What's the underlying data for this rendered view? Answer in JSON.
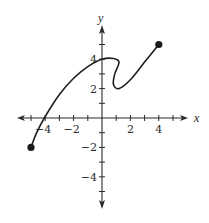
{
  "chart_data": {
    "type": "line",
    "title": "",
    "xlabel": "x",
    "ylabel": "y",
    "xlim": [
      -6,
      6
    ],
    "ylim": [
      -6,
      6
    ],
    "grid": false,
    "x_ticks": [
      -5,
      -4,
      -3,
      -2,
      -1,
      1,
      2,
      3,
      4,
      5
    ],
    "x_tick_labels": [
      {
        "value": -4,
        "label": "−4"
      },
      {
        "value": -2,
        "label": "−2"
      },
      {
        "value": 2,
        "label": "2"
      },
      {
        "value": 4,
        "label": "4"
      }
    ],
    "y_ticks": [
      -5,
      -4,
      -3,
      -2,
      -1,
      1,
      2,
      3,
      4,
      5
    ],
    "y_tick_labels": [
      {
        "value": 4,
        "label": "4"
      },
      {
        "value": 2,
        "label": "2"
      },
      {
        "value": -2,
        "label": "−2"
      },
      {
        "value": -4,
        "label": "−4"
      }
    ],
    "series": [
      {
        "name": "curve",
        "points": [
          [
            -5,
            -2
          ],
          [
            -4.6,
            -1
          ],
          [
            -4,
            0.1
          ],
          [
            -3,
            1.6
          ],
          [
            -2,
            2.7
          ],
          [
            -1,
            3.5
          ],
          [
            0,
            4
          ],
          [
            0.8,
            4.05
          ],
          [
            1.2,
            3.8
          ],
          [
            0.9,
            3.0
          ],
          [
            0.8,
            2.3
          ],
          [
            1.2,
            2.0
          ],
          [
            2,
            2.6
          ],
          [
            3,
            3.8
          ],
          [
            4,
            5
          ]
        ],
        "endpoints": [
          [
            -5,
            -2
          ],
          [
            4,
            5
          ]
        ],
        "endpoint_style": "closed-dot"
      }
    ]
  },
  "labels": {
    "x_axis": "x",
    "y_axis": "y"
  }
}
